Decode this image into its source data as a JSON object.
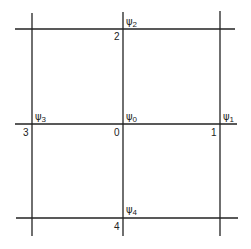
{
  "diagram": {
    "line_color": "#222222",
    "background": "#ffffff",
    "grid": {
      "vertical_x": [
        32,
        123,
        220
      ],
      "horizontal_y": [
        29,
        124,
        218
      ]
    },
    "node_numbers": [
      {
        "id": "node-0",
        "text": "0"
      },
      {
        "id": "node-1",
        "text": "1"
      },
      {
        "id": "node-2",
        "text": "2"
      },
      {
        "id": "node-3",
        "text": "3"
      },
      {
        "id": "node-4",
        "text": "4"
      }
    ],
    "psi_labels": [
      {
        "id": "psi-0",
        "symbol": "ψ",
        "subscript": "0"
      },
      {
        "id": "psi-1",
        "symbol": "ψ",
        "subscript": "1"
      },
      {
        "id": "psi-2",
        "symbol": "ψ",
        "subscript": "2"
      },
      {
        "id": "psi-3",
        "symbol": "ψ",
        "subscript": "3"
      },
      {
        "id": "psi-4",
        "symbol": "ψ",
        "subscript": "4"
      }
    ]
  }
}
